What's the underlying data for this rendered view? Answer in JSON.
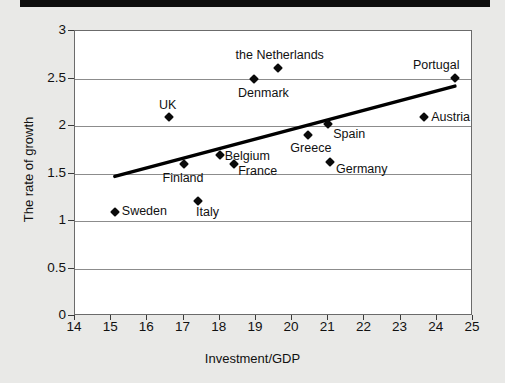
{
  "chart_data": {
    "type": "scatter",
    "title": "",
    "xlabel": "Investment/GDP",
    "ylabel": "The rate of growth",
    "xlim": [
      14,
      25
    ],
    "ylim": [
      0,
      3
    ],
    "xticks": [
      14,
      15,
      16,
      17,
      18,
      19,
      20,
      21,
      22,
      23,
      24,
      25
    ],
    "xtick_labels": [
      "14",
      "15",
      "16",
      "17",
      "18",
      "19",
      "20",
      "21",
      "22",
      "23",
      "24",
      "25"
    ],
    "yticks": [
      0,
      0.5,
      1,
      1.5,
      2,
      2.5,
      3
    ],
    "ytick_labels": [
      "0",
      "0.5",
      "1",
      "1.5",
      "2",
      "2.5",
      "3"
    ],
    "grid": "horizontal",
    "legend": "none",
    "points": [
      {
        "label": "Sweden",
        "x": 15.1,
        "y": 1.1,
        "label_dx": 7,
        "label_dy": -1,
        "align": "left"
      },
      {
        "label": "Italy",
        "x": 17.4,
        "y": 1.21,
        "label_dx": -2,
        "label_dy": 11,
        "align": "left"
      },
      {
        "label": "Finland",
        "x": 17.0,
        "y": 1.6,
        "label_dx": -21,
        "label_dy": 14,
        "align": "left"
      },
      {
        "label": "Belgium",
        "x": 18.0,
        "y": 1.7,
        "label_dx": 5,
        "label_dy": 1,
        "align": "left"
      },
      {
        "label": "France",
        "x": 18.4,
        "y": 1.6,
        "label_dx": 4,
        "label_dy": 7,
        "align": "left"
      },
      {
        "label": "UK",
        "x": 16.6,
        "y": 2.1,
        "label_dx": -10,
        "label_dy": -12,
        "align": "left"
      },
      {
        "label": "Denmark",
        "x": 18.95,
        "y": 2.5,
        "label_dx": -16,
        "label_dy": 14,
        "align": "left"
      },
      {
        "label": "the Netherlands",
        "x": 19.6,
        "y": 2.61,
        "label_dx": -42,
        "label_dy": -13,
        "align": "left"
      },
      {
        "label": "Greece",
        "x": 20.45,
        "y": 1.91,
        "label_dx": -18,
        "label_dy": 13,
        "align": "left"
      },
      {
        "label": "Spain",
        "x": 21.0,
        "y": 2.02,
        "label_dx": 5,
        "label_dy": 10,
        "align": "left"
      },
      {
        "label": "Germany",
        "x": 21.05,
        "y": 1.62,
        "label_dx": 6,
        "label_dy": 7,
        "align": "left"
      },
      {
        "label": "Austria",
        "x": 23.65,
        "y": 2.1,
        "label_dx": 7,
        "label_dy": 0,
        "align": "left"
      },
      {
        "label": "Portugal",
        "x": 24.5,
        "y": 2.51,
        "label_dx": -42,
        "label_dy": -13,
        "align": "left"
      }
    ],
    "trendline": {
      "x0": 15.1,
      "y0": 1.47,
      "x1": 24.5,
      "y1": 2.42,
      "color": "#000000",
      "width": 3.5
    },
    "colors": {
      "marker": "#0a0a0a",
      "background": "#e9e9e7",
      "plot_background": "#ffffff",
      "gridline": "#8c8c8c",
      "frame": "#6b6b6b",
      "top_rule": "#0d0d0d"
    }
  }
}
